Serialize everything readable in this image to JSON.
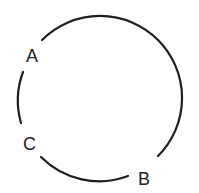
{
  "diagram": {
    "type": "circle-with-labeled-points",
    "stroke_color": "#1e1e1e",
    "points": [
      {
        "label": "A",
        "position": "upper-left"
      },
      {
        "label": "B",
        "position": "lower-right"
      },
      {
        "label": "C",
        "position": "lower-left"
      }
    ]
  }
}
